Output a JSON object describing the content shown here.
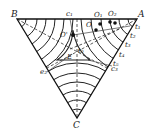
{
  "diagram": {
    "type": "ternary-triangle-contour",
    "colors": {
      "line": "#222222",
      "background": "#ffffff"
    },
    "vertices": {
      "A": {
        "label": "A",
        "x": 137,
        "y": 19
      },
      "B": {
        "label": "B",
        "x": 17,
        "y": 19
      },
      "C": {
        "label": "C",
        "x": 77,
        "y": 118
      }
    },
    "labels": {
      "B": "B",
      "A": "A",
      "C": "C",
      "c1": "c₁",
      "O1": "O₁",
      "O2": "O₂",
      "O": "O",
      "O_prime": "O'",
      "t0": "t₀",
      "t1": "t₁",
      "t2": "t₂",
      "t3": "t₃",
      "t4": "t₄",
      "t5": "t₅",
      "c3": "c₃",
      "e2": "e₂",
      "E": "E"
    },
    "points": [
      {
        "name": "O1",
        "x": 100,
        "y": 25
      },
      {
        "name": "O2",
        "x": 110,
        "y": 22
      },
      {
        "name": "O2b",
        "x": 114,
        "y": 23
      },
      {
        "name": "O",
        "x": 96,
        "y": 30
      },
      {
        "name": "O_prime",
        "x": 73,
        "y": 35
      }
    ]
  }
}
